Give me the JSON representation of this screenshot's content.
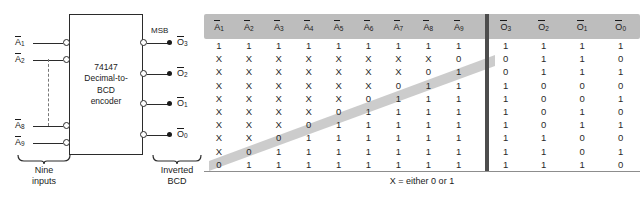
{
  "diagram": {
    "chip": {
      "label": "74147\nDecimal-to-\nBCD\nencoder"
    },
    "msb_label": "MSB",
    "inputs": [
      {
        "name": "A1",
        "base": "A",
        "sub": "1"
      },
      {
        "name": "A2",
        "base": "A",
        "sub": "2"
      },
      {
        "name": "A8",
        "base": "A",
        "sub": "8"
      },
      {
        "name": "A9",
        "base": "A",
        "sub": "9"
      }
    ],
    "outputs": [
      {
        "name": "O3",
        "base": "O",
        "sub": "3"
      },
      {
        "name": "O2",
        "base": "O",
        "sub": "2"
      },
      {
        "name": "O1",
        "base": "O",
        "sub": "1"
      },
      {
        "name": "O0",
        "base": "O",
        "sub": "0"
      }
    ],
    "input_brace_label": "Nine\ninputs",
    "output_brace_label": "Inverted\nBCD"
  },
  "truth_table": {
    "caption": "X = either 0 or 1",
    "input_headers": [
      {
        "base": "A",
        "sub": "1"
      },
      {
        "base": "A",
        "sub": "2"
      },
      {
        "base": "A",
        "sub": "3"
      },
      {
        "base": "A",
        "sub": "4"
      },
      {
        "base": "A",
        "sub": "5"
      },
      {
        "base": "A",
        "sub": "6"
      },
      {
        "base": "A",
        "sub": "7"
      },
      {
        "base": "A",
        "sub": "8"
      },
      {
        "base": "A",
        "sub": "9"
      }
    ],
    "output_headers": [
      {
        "base": "O",
        "sub": "3"
      },
      {
        "base": "O",
        "sub": "2"
      },
      {
        "base": "O",
        "sub": "1"
      },
      {
        "base": "O",
        "sub": "0"
      }
    ],
    "rows": [
      {
        "inputs": [
          "1",
          "1",
          "1",
          "1",
          "1",
          "1",
          "1",
          "1",
          "1"
        ],
        "outputs": [
          "1",
          "1",
          "1",
          "1"
        ]
      },
      {
        "inputs": [
          "X",
          "X",
          "X",
          "X",
          "X",
          "X",
          "X",
          "X",
          "0"
        ],
        "outputs": [
          "0",
          "1",
          "1",
          "0"
        ]
      },
      {
        "inputs": [
          "X",
          "X",
          "X",
          "X",
          "X",
          "X",
          "X",
          "0",
          "1"
        ],
        "outputs": [
          "0",
          "1",
          "1",
          "1"
        ]
      },
      {
        "inputs": [
          "X",
          "X",
          "X",
          "X",
          "X",
          "X",
          "0",
          "1",
          "1"
        ],
        "outputs": [
          "1",
          "0",
          "0",
          "0"
        ]
      },
      {
        "inputs": [
          "X",
          "X",
          "X",
          "X",
          "X",
          "0",
          "1",
          "1",
          "1"
        ],
        "outputs": [
          "1",
          "0",
          "0",
          "1"
        ]
      },
      {
        "inputs": [
          "X",
          "X",
          "X",
          "X",
          "0",
          "1",
          "1",
          "1",
          "1"
        ],
        "outputs": [
          "1",
          "0",
          "1",
          "0"
        ]
      },
      {
        "inputs": [
          "X",
          "X",
          "X",
          "0",
          "1",
          "1",
          "1",
          "1",
          "1"
        ],
        "outputs": [
          "1",
          "0",
          "1",
          "1"
        ]
      },
      {
        "inputs": [
          "X",
          "X",
          "0",
          "1",
          "1",
          "1",
          "1",
          "1",
          "1"
        ],
        "outputs": [
          "1",
          "1",
          "0",
          "0"
        ]
      },
      {
        "inputs": [
          "X",
          "0",
          "1",
          "1",
          "1",
          "1",
          "1",
          "1",
          "1"
        ],
        "outputs": [
          "1",
          "1",
          "0",
          "1"
        ]
      },
      {
        "inputs": [
          "0",
          "1",
          "1",
          "1",
          "1",
          "1",
          "1",
          "1",
          "1"
        ],
        "outputs": [
          "1",
          "1",
          "1",
          "0"
        ]
      }
    ]
  },
  "colors": {
    "header_band": "#bdbdbd",
    "diagonal_band": "#c7c7c7",
    "divider": "#4d4d4d",
    "ink": "#1a1a1a",
    "page": "#ffffff"
  }
}
